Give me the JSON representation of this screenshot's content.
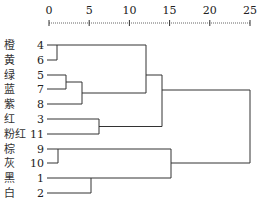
{
  "chart_data": {
    "type": "dendrogram",
    "title": "",
    "xlabel": "",
    "ylabel": "",
    "axis": {
      "ticks": [
        0,
        5,
        10,
        15,
        20,
        25
      ],
      "range": [
        0,
        25
      ],
      "position": "top"
    },
    "leaves": [
      {
        "id": 4,
        "label": "橙"
      },
      {
        "id": 6,
        "label": "黄"
      },
      {
        "id": 5,
        "label": "绿"
      },
      {
        "id": 7,
        "label": "蓝"
      },
      {
        "id": 8,
        "label": "紫"
      },
      {
        "id": 3,
        "label": "红"
      },
      {
        "id": 11,
        "label": "粉红"
      },
      {
        "id": 9,
        "label": "棕"
      },
      {
        "id": 10,
        "label": "灰"
      },
      {
        "id": 1,
        "label": "黑"
      },
      {
        "id": 2,
        "label": "白"
      }
    ],
    "merges": [
      {
        "members": [
          4,
          6
        ],
        "height": 1
      },
      {
        "members": [
          5,
          7
        ],
        "height": 2
      },
      {
        "members": [
          9,
          10
        ],
        "height": 1
      },
      {
        "members": [
          "5-7",
          8
        ],
        "height": 4
      },
      {
        "members": [
          1,
          2
        ],
        "height": 5
      },
      {
        "members": [
          3,
          11
        ],
        "height": 6
      },
      {
        "members": [
          "4-6",
          "5-7-8"
        ],
        "height": 12
      },
      {
        "members": [
          "4-6-5-7-8",
          "3-11"
        ],
        "height": 14
      },
      {
        "members": [
          "9-10",
          "1-2"
        ],
        "height": 15
      },
      {
        "members": [
          "top",
          "bottom"
        ],
        "height": 25
      }
    ]
  }
}
